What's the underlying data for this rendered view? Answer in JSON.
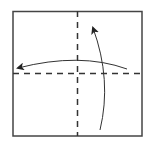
{
  "diagram": {
    "type": "origami-fold",
    "square": {
      "x": 13,
      "y": 11,
      "width": 129,
      "height": 125,
      "stroke": "#444444"
    },
    "fold_lines": [
      {
        "name": "vertical-center",
        "style": "dashed",
        "x1": 77,
        "y1": 11,
        "x2": 77,
        "y2": 136
      },
      {
        "name": "horizontal-center",
        "style": "dashed",
        "x1": 13,
        "y1": 73,
        "x2": 142,
        "y2": 73
      }
    ],
    "arrows": [
      {
        "name": "fold-left-arrow",
        "direction": "right-to-left"
      },
      {
        "name": "fold-up-arrow",
        "direction": "bottom-to-top"
      }
    ],
    "colors": {
      "line": "#333333",
      "border": "#444444",
      "background": "#ffffff"
    }
  }
}
